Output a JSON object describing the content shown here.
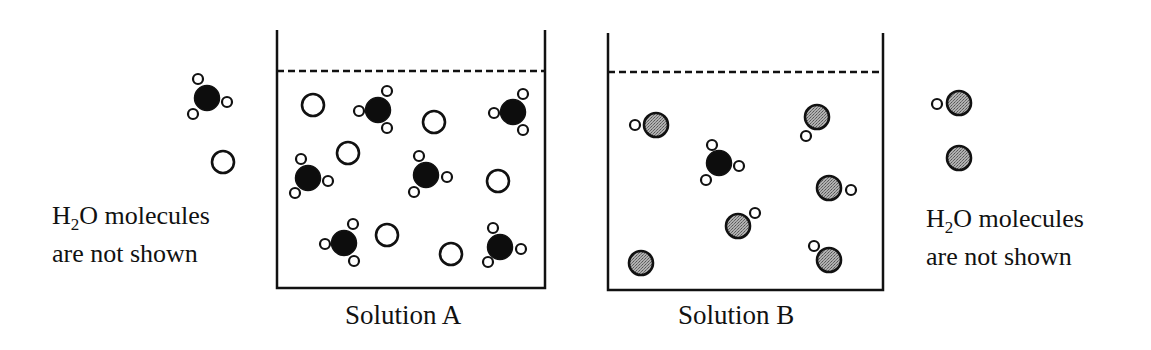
{
  "figure": {
    "type": "chemistry particle diagram",
    "colors": {
      "line": "#111111",
      "solute_black": "#0d0d0d",
      "solute_gray": "#9a9a9a",
      "open_circle_fill": "#ffffff"
    }
  },
  "left_legend": {
    "note_line1_prefix": "H",
    "note_line1_sub": "2",
    "note_line1_suffix": "O molecules",
    "note_line2": "are not shown",
    "particles": [
      {
        "kind": "black-with-3-small",
        "x": 207,
        "y": 98,
        "smalls": [
          [
            198,
            79
          ],
          [
            227,
            102
          ],
          [
            193,
            114
          ]
        ]
      },
      {
        "kind": "open",
        "x": 223,
        "y": 162
      }
    ]
  },
  "right_legend": {
    "note_line1_prefix": "H",
    "note_line1_sub": "2",
    "note_line1_suffix": "O molecules",
    "note_line2": "are not shown",
    "particles": [
      {
        "kind": "gray-with-1-small",
        "x": 959,
        "y": 103,
        "smalls": [
          [
            937,
            104
          ]
        ]
      },
      {
        "kind": "gray",
        "x": 959,
        "y": 158
      }
    ]
  },
  "beakers": [
    {
      "label": "Solution A",
      "left": 277,
      "right": 545,
      "top": 30,
      "bottom": 288,
      "liquid_level": 71,
      "particles": [
        {
          "kind": "open",
          "x": 313,
          "y": 105
        },
        {
          "kind": "black",
          "x": 378,
          "y": 110,
          "smalls": [
            [
              387,
              91
            ],
            [
              359,
              111
            ],
            [
              387,
              128
            ]
          ]
        },
        {
          "kind": "open",
          "x": 434,
          "y": 122
        },
        {
          "kind": "black",
          "x": 513,
          "y": 112,
          "smalls": [
            [
              523,
              94
            ],
            [
              494,
              113
            ],
            [
              523,
              130
            ]
          ]
        },
        {
          "kind": "open",
          "x": 348,
          "y": 153
        },
        {
          "kind": "black",
          "x": 308,
          "y": 178,
          "smalls": [
            [
              301,
              159
            ],
            [
              328,
              181
            ],
            [
              295,
              193
            ]
          ]
        },
        {
          "kind": "black",
          "x": 426,
          "y": 175,
          "smalls": [
            [
              419,
              156
            ],
            [
              447,
              177
            ],
            [
              414,
              192
            ]
          ]
        },
        {
          "kind": "open",
          "x": 498,
          "y": 181
        },
        {
          "kind": "black",
          "x": 344,
          "y": 243,
          "smalls": [
            [
              353,
              224
            ],
            [
              325,
              244
            ],
            [
              354,
              261
            ]
          ]
        },
        {
          "kind": "open",
          "x": 387,
          "y": 235
        },
        {
          "kind": "open",
          "x": 451,
          "y": 254
        },
        {
          "kind": "black",
          "x": 500,
          "y": 247,
          "smalls": [
            [
              493,
              228
            ],
            [
              521,
              249
            ],
            [
              488,
              262
            ]
          ]
        }
      ]
    },
    {
      "label": "Solution B",
      "left": 608,
      "right": 883,
      "top": 33,
      "bottom": 290,
      "liquid_level": 72,
      "particles": [
        {
          "kind": "gray",
          "x": 656,
          "y": 125,
          "smalls": [
            [
              635,
              125
            ]
          ]
        },
        {
          "kind": "gray",
          "x": 817,
          "y": 117,
          "smalls": [
            [
              806,
              136
            ]
          ]
        },
        {
          "kind": "black",
          "x": 719,
          "y": 163,
          "smalls": [
            [
              712,
              145
            ],
            [
              739,
              166
            ],
            [
              706,
              180
            ]
          ]
        },
        {
          "kind": "gray",
          "x": 829,
          "y": 188,
          "smalls": [
            [
              851,
              190
            ]
          ]
        },
        {
          "kind": "gray",
          "x": 738,
          "y": 226,
          "smalls": [
            [
              755,
              213
            ]
          ]
        },
        {
          "kind": "gray",
          "x": 641,
          "y": 263
        },
        {
          "kind": "gray",
          "x": 829,
          "y": 260,
          "smalls": [
            [
              814,
              246
            ]
          ]
        }
      ]
    }
  ]
}
